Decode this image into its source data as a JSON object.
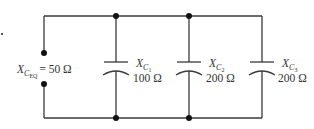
{
  "diagram": {
    "type": "circuit-schematic",
    "colors": {
      "wire": "#3a3a3a",
      "node": "#111111",
      "text": "#333333"
    },
    "equivalent": {
      "symbol": "X",
      "subscript": "C",
      "subsubscript": "EQ",
      "value": "= 50 Ω"
    },
    "capacitors": [
      {
        "symbol": "X",
        "subscript": "C",
        "subsubscript": "1",
        "value": "100 Ω"
      },
      {
        "symbol": "X",
        "subscript": "C",
        "subsubscript": "2",
        "value": "200 Ω"
      },
      {
        "symbol": "X",
        "subscript": "C",
        "subsubscript": "3",
        "value": "200 Ω"
      }
    ]
  }
}
